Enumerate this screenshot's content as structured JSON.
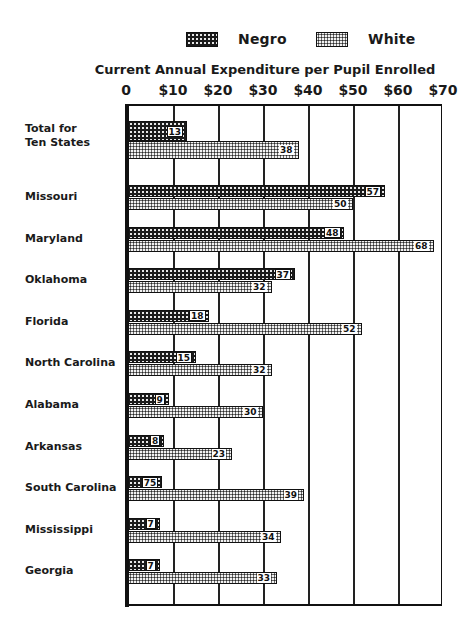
{
  "chart_data": {
    "type": "bar",
    "orientation": "horizontal",
    "title": "Current Annual Expenditure per Pupil Enrolled",
    "xlabel": "Current Annual Expenditure per Pupil Enrolled",
    "ylabel": "",
    "xlim": [
      0,
      70
    ],
    "x_ticks": [
      "0",
      "$10",
      "$20",
      "$30",
      "$40",
      "$50",
      "$60",
      "$70"
    ],
    "grid": true,
    "legend_position": "top",
    "legend": [
      "Negro",
      "White"
    ],
    "categories": [
      "Total for Ten States",
      "Missouri",
      "Maryland",
      "Oklahoma",
      "Florida",
      "North Carolina",
      "Alabama",
      "Arkansas",
      "South Carolina",
      "Mississippi",
      "Georgia"
    ],
    "category_labels": [
      [
        "Total for",
        "Ten States"
      ],
      [
        "Missouri"
      ],
      [
        "Maryland"
      ],
      [
        "Oklahoma"
      ],
      [
        "Florida"
      ],
      [
        "North Carolina"
      ],
      [
        "Alabama"
      ],
      [
        "Arkansas"
      ],
      [
        "South Carolina"
      ],
      [
        "Mississippi"
      ],
      [
        "Georgia"
      ]
    ],
    "series": [
      {
        "name": "Negro",
        "values": [
          13,
          57,
          48,
          37,
          18,
          15,
          9,
          8,
          7.5,
          7,
          7
        ],
        "labels": [
          "13",
          "57",
          "48",
          "37",
          "18",
          "15",
          "9",
          "8",
          "75",
          "7",
          "7"
        ]
      },
      {
        "name": "White",
        "values": [
          38,
          50,
          68,
          32,
          52,
          32,
          30,
          23,
          39,
          34,
          33
        ],
        "labels": [
          "38",
          "50",
          "68",
          "32",
          "52",
          "32",
          "30",
          "23",
          "39",
          "34",
          "33"
        ]
      }
    ]
  },
  "legend": {
    "negro_label": "Negro",
    "white_label": "White"
  },
  "colors": {
    "negro_fill": "#1b1b1b",
    "white_fill": "#f2f2f2",
    "ink": "#111111"
  }
}
